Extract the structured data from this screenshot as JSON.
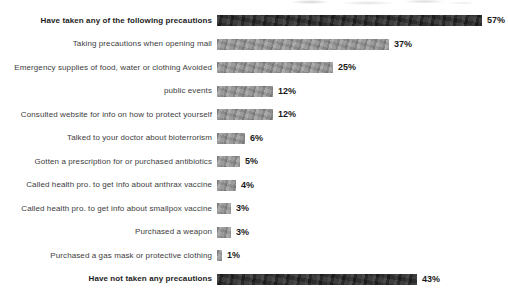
{
  "chart_data": {
    "type": "bar",
    "orientation": "horizontal",
    "title": "",
    "unit": "%",
    "xlim": [
      0,
      60
    ],
    "grid": false,
    "legend": "none",
    "value_label_position": "end-of-bar",
    "bar_color_default": "#9b9b9b",
    "bar_color_emphasis": "#2d2d2d",
    "categories": [
      "Have taken any of the following precautions",
      "Taking precautions when opening mail",
      "Emergency supplies of food, water or clothing Avoided",
      "public events",
      "Consulted website for info on how to protect yourself",
      "Talked to your doctor about bioterrorism",
      "Gotten a prescription for or purchased antibiotics",
      "Called health pro. to get info about anthrax vaccine",
      "Called health pro. to get info about smallpox vaccine",
      "Purchased a weapon",
      "Purchased a gas mask or protective clothing",
      "Have not taken any precautions"
    ],
    "values": [
      57,
      37,
      25,
      12,
      12,
      6,
      5,
      4,
      3,
      3,
      1,
      43
    ],
    "rows": [
      {
        "label": "Have taken any of the following precautions",
        "value": 57,
        "display": "57%",
        "emphasis": true
      },
      {
        "label": "Taking precautions when opening mail",
        "value": 37,
        "display": "37%",
        "emphasis": false
      },
      {
        "label": "Emergency supplies of food, water or clothing Avoided",
        "value": 25,
        "display": "25%",
        "emphasis": false
      },
      {
        "label": "public events",
        "value": 12,
        "display": "12%",
        "emphasis": false
      },
      {
        "label": "Consulted website for info on how to protect yourself",
        "value": 12,
        "display": "12%",
        "emphasis": false
      },
      {
        "label": "Talked to your doctor about bioterrorism",
        "value": 6,
        "display": "6%",
        "emphasis": false
      },
      {
        "label": "Gotten a prescription for or purchased antibiotics",
        "value": 5,
        "display": "5%",
        "emphasis": false
      },
      {
        "label": "Called health pro. to get info about anthrax vaccine",
        "value": 4,
        "display": "4%",
        "emphasis": false
      },
      {
        "label": "Called health pro. to get info about smallpox vaccine",
        "value": 3,
        "display": "3%",
        "emphasis": false
      },
      {
        "label": "Purchased a weapon",
        "value": 3,
        "display": "3%",
        "emphasis": false
      },
      {
        "label": "Purchased a gas mask or protective clothing",
        "value": 1,
        "display": "1%",
        "emphasis": false
      },
      {
        "label": "Have not taken any precautions",
        "value": 43,
        "display": "43%",
        "emphasis": true
      }
    ]
  }
}
